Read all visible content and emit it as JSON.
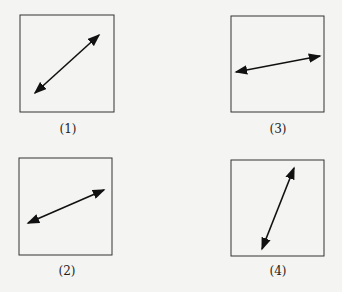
{
  "panels": [
    {
      "label": "(1)",
      "box": [
        20,
        15,
        94,
        97
      ],
      "arrow": [
        35,
        93,
        99,
        35
      ],
      "label_pos": [
        48,
        122
      ]
    },
    {
      "label": "(3)",
      "box": [
        231,
        16,
        93,
        96
      ],
      "arrow": [
        236,
        72,
        320,
        56
      ],
      "label_pos": [
        258,
        122
      ]
    },
    {
      "label": "(2)",
      "box": [
        19,
        158,
        93,
        97
      ],
      "arrow": [
        28,
        223,
        104,
        190
      ],
      "label_pos": [
        47,
        264
      ]
    },
    {
      "label": "(4)",
      "box": [
        231,
        160,
        93,
        96
      ],
      "arrow": [
        262,
        249,
        294,
        168
      ],
      "label_pos": [
        258,
        264
      ]
    }
  ],
  "colors": {
    "stroke": "#333333",
    "arrow": "#111111"
  }
}
